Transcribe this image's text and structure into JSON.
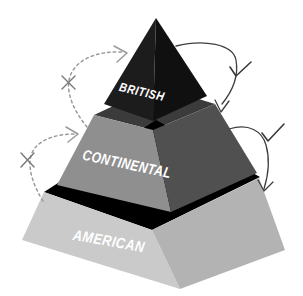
{
  "diagram": {
    "background_color": "#ffffff",
    "tiers": [
      {
        "label": "BRITISH",
        "label_color": "#ffffff",
        "face_left_color": "#1c1c1c",
        "face_right_color": "#101010",
        "top_face_color": "#474747"
      },
      {
        "label": "CONTINENTAL",
        "label_color": "#ffffff",
        "face_left_color": "#8f8f8f",
        "face_right_color": "#505050",
        "top_face_color": "#3b3b3b"
      },
      {
        "label": "AMERICAN",
        "label_color": "#ffffff",
        "face_left_color": "#cacaca",
        "face_right_color": "#b3b3b3"
      }
    ],
    "annotations": {
      "left_marks": [
        {
          "symbol": "×",
          "style": "dashed-arrow"
        },
        {
          "symbol": "×",
          "style": "dashed-arrow"
        }
      ],
      "right_marks": [
        {
          "symbol": "✓",
          "style": "solid-arrow"
        },
        {
          "symbol": "✓",
          "style": "solid-arrow"
        }
      ],
      "dashed_arrow_color": "#9a9a9a",
      "solid_arrow_color": "#3f3f3f",
      "cross_color": "#787878",
      "check_color": "#3a3a3a"
    }
  }
}
